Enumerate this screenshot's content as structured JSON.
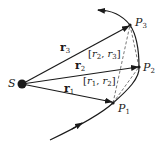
{
  "diagram": {
    "origin": {
      "label": "S"
    },
    "points": [
      {
        "id": "P1",
        "label": "P",
        "sub": "1"
      },
      {
        "id": "P2",
        "label": "P",
        "sub": "2"
      },
      {
        "id": "P3",
        "label": "P",
        "sub": "3"
      }
    ],
    "vectors": [
      {
        "label": "r",
        "sub": "1"
      },
      {
        "label": "r",
        "sub": "2"
      },
      {
        "label": "r",
        "sub": "3"
      }
    ],
    "sectors": [
      {
        "open": "[",
        "a": "r",
        "a_sub": "1",
        "sep": ", ",
        "b": "r",
        "b_sub": "2",
        "close": "]"
      },
      {
        "open": "[",
        "a": "r",
        "a_sub": "2",
        "sep": ", ",
        "b": "r",
        "b_sub": "3",
        "close": "]"
      }
    ],
    "colors": {
      "ink": "#1a1a1a",
      "background": "#ffffff"
    }
  }
}
